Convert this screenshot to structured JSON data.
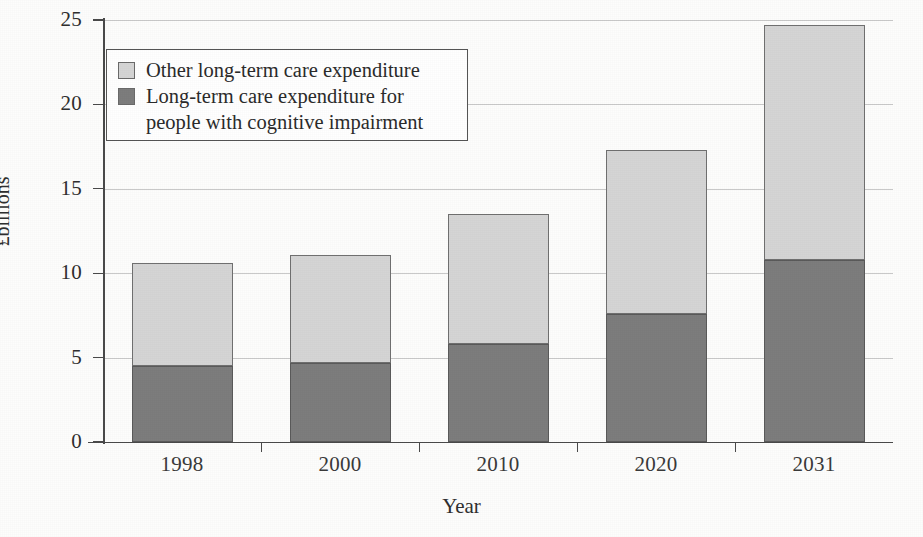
{
  "chart_data": {
    "type": "bar",
    "subtype": "stacked",
    "title": "",
    "xlabel": "Year",
    "ylabel": "£billions",
    "categories": [
      "1998",
      "2000",
      "2010",
      "2020",
      "2031"
    ],
    "series": [
      {
        "name": "Long-term care expenditure for people with cognitive impairment",
        "legend_label": "Long-term care expenditure for\npeople with cognitive impairment",
        "color": "#7d7d7d",
        "values": [
          4.5,
          4.7,
          5.8,
          7.6,
          10.8
        ]
      },
      {
        "name": "Other long-term care expenditure",
        "legend_label": "Other long-term care expenditure",
        "color": "#d5d5d5",
        "values": [
          6.1,
          6.4,
          7.7,
          9.7,
          13.9
        ]
      }
    ],
    "totals": [
      10.6,
      11.1,
      13.5,
      17.3,
      24.7
    ],
    "ylim": [
      0,
      25
    ],
    "yticks": [
      0,
      5,
      10,
      15,
      20,
      25
    ],
    "ytick_labels": [
      "0",
      "5",
      "10",
      "15",
      "20",
      "25"
    ],
    "grid": true,
    "grid_axis": "y",
    "legend_position": "upper-left-inside"
  },
  "axes": {
    "y_title": "£billions",
    "x_title": "Year"
  },
  "legend": {
    "entries": [
      {
        "label": "Other long-term care expenditure",
        "swatch_color": "#d5d5d5",
        "swatch_name": "legend-swatch-other"
      },
      {
        "label": "Long-term care expenditure for\npeople with cognitive impairment",
        "swatch_color": "#7d7d7d",
        "swatch_name": "legend-swatch-cognitive"
      }
    ]
  },
  "colors": {
    "segment_other": "#d5d5d5",
    "segment_cognitive": "#7d7d7d",
    "axis": "#4a4a4a",
    "grid": "#c9c9c9",
    "text": "#2b2b2b",
    "background": "#fdfdfc"
  }
}
